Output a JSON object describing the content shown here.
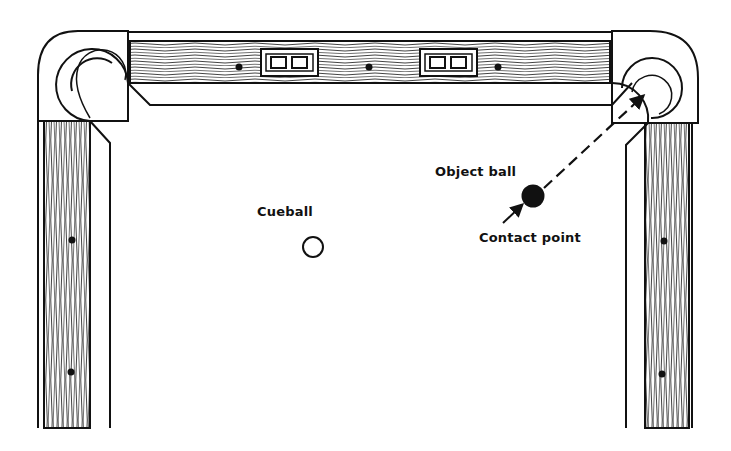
{
  "diagram": {
    "labels": {
      "object_ball": "Object ball",
      "cueball": "Cueball",
      "contact_point": "Contact point"
    },
    "elements": {
      "top_rail_plates": 2,
      "top_rail_diamonds": 3,
      "left_rail_diamonds": 2,
      "right_rail_diamonds": 2,
      "pockets": [
        "top-left corner pocket",
        "top-right corner pocket"
      ]
    },
    "aim_line": {
      "style": "dashed",
      "from": "contact point",
      "to": "top-right corner pocket"
    },
    "colors": {
      "ink": "#111111",
      "background": "#ffffff",
      "object_ball": "#111111",
      "cueball": "#ffffff"
    }
  }
}
